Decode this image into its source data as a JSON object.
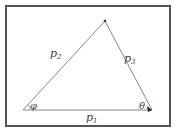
{
  "diagram": {
    "type": "vector-triangle",
    "vertices": {
      "left": {
        "x": 23,
        "y": 110
      },
      "top": {
        "x": 105,
        "y": 21
      },
      "right": {
        "x": 152,
        "y": 110
      }
    },
    "edges": [
      {
        "name": "p1",
        "label": "p",
        "subscript": "1",
        "from": "left",
        "to": "right"
      },
      {
        "name": "p2",
        "label": "p",
        "subscript": "2",
        "from": "left",
        "to": "top"
      },
      {
        "name": "p3",
        "label": "p",
        "subscript": "3",
        "from": "top",
        "to": "right"
      }
    ],
    "angles": [
      {
        "symbol": "φ",
        "vertex": "left"
      },
      {
        "symbol": "θ",
        "vertex": "right"
      }
    ],
    "colors": {
      "line": "#888888",
      "border": "#555555",
      "text": "#444444"
    }
  }
}
